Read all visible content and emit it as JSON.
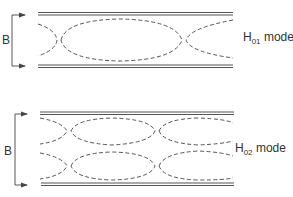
{
  "diagram": {
    "top": {
      "mode_prefix": "H",
      "mode_subscript": "01",
      "mode_suffix": " mode",
      "dimension_label": "B"
    },
    "bottom": {
      "mode_prefix": "H",
      "mode_subscript": "02",
      "mode_suffix": " mode",
      "dimension_label": "B"
    },
    "colors": {
      "line": "#555555",
      "text": "#333333"
    }
  }
}
